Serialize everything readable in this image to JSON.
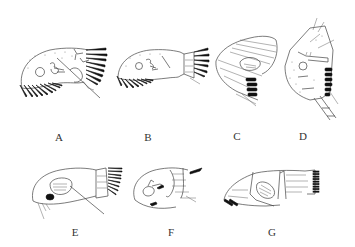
{
  "figure": {
    "panels": [
      {
        "id": "A",
        "label": "A",
        "x": 59,
        "y": 137
      },
      {
        "id": "B",
        "label": "B",
        "x": 148,
        "y": 137
      },
      {
        "id": "C",
        "label": "C",
        "x": 237,
        "y": 136
      },
      {
        "id": "D",
        "label": "D",
        "x": 303,
        "y": 136
      },
      {
        "id": "E",
        "label": "E",
        "x": 75,
        "y": 232
      },
      {
        "id": "F",
        "label": "F",
        "x": 171,
        "y": 232
      },
      {
        "id": "G",
        "label": "G",
        "x": 272,
        "y": 232
      }
    ]
  }
}
